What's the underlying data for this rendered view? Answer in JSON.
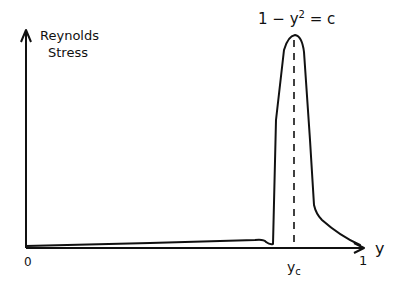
{
  "diagram": {
    "y_axis_label_line1": "Reynolds",
    "y_axis_label_line2": "Stress",
    "x_axis_label": "y",
    "origin_label": "0",
    "x_end_label": "1",
    "critical_point_label": "y",
    "critical_point_subscript": "c",
    "annotation_prefix": "1 − y",
    "annotation_superscript": "2",
    "annotation_suffix": " = c",
    "stroke_color": "#111111",
    "background_color": "#ffffff"
  }
}
